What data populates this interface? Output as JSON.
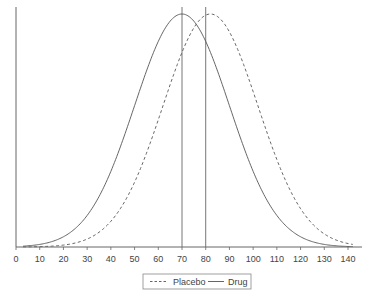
{
  "chart_data": {
    "type": "line",
    "title": "",
    "xlabel": "",
    "ylabel": "",
    "xlim": [
      0,
      145
    ],
    "xticks": [
      0,
      10,
      20,
      30,
      40,
      50,
      60,
      70,
      80,
      90,
      100,
      110,
      120,
      130,
      140
    ],
    "grid": false,
    "legend_position": "bottom-center",
    "series": [
      {
        "name": "Placebo",
        "style": "dashed",
        "distribution": "normal",
        "mean": 82,
        "sd": 20
      },
      {
        "name": "Drug",
        "style": "solid",
        "distribution": "normal",
        "mean": 70,
        "sd": 20
      }
    ],
    "reference_lines": [
      {
        "orientation": "vertical",
        "x": 70,
        "label": ""
      },
      {
        "orientation": "vertical",
        "x": 80,
        "label": ""
      }
    ]
  },
  "legend": {
    "items": [
      {
        "label": "Placebo",
        "style": "dashed"
      },
      {
        "label": "Drug",
        "style": "solid"
      }
    ]
  },
  "colors": {
    "line": "#555555",
    "axis": "#666666"
  }
}
